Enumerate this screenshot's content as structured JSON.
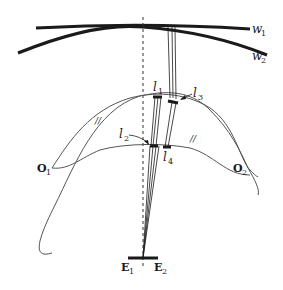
{
  "diagram": {
    "type": "optical ray diagram",
    "wavefronts": [
      {
        "id": "w1",
        "label": "w",
        "sub": "1"
      },
      {
        "id": "w2",
        "label": "w",
        "sub": "2"
      }
    ],
    "lens_segments": [
      {
        "id": "l1",
        "label": "l",
        "sub": "1"
      },
      {
        "id": "l2",
        "label": "l",
        "sub": "2"
      },
      {
        "id": "l3",
        "label": "l",
        "sub": "3"
      },
      {
        "id": "l4",
        "label": "l",
        "sub": "4"
      }
    ],
    "points": [
      {
        "id": "O1",
        "label": "O",
        "sub": "1"
      },
      {
        "id": "O2",
        "label": "O",
        "sub": "2"
      },
      {
        "id": "E1",
        "label": "E",
        "sub": "1"
      },
      {
        "id": "E2",
        "label": "E",
        "sub": "2"
      }
    ],
    "hatch_marks": [
      "//",
      "//"
    ],
    "colors": {
      "ink": "#1a1a1a",
      "curve": "#555555",
      "background": "#ffffff"
    }
  }
}
